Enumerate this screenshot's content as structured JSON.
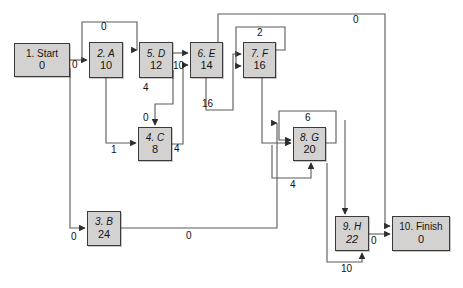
{
  "diagram": {
    "node_fill": "#d4d2d0",
    "node_stroke": "#3a3a3a",
    "edge_stroke": "#5a5a5a",
    "background": "#ffffff",
    "nodes": [
      {
        "id": "start",
        "name": "1. Start",
        "duration": "0",
        "italic_name": false,
        "italic_dur": false,
        "x": 14,
        "y": 43,
        "w": 56,
        "h": 34
      },
      {
        "id": "a",
        "name": "2. A",
        "duration": "10",
        "italic_name": true,
        "italic_dur": false,
        "x": 89,
        "y": 42,
        "w": 34,
        "h": 36
      },
      {
        "id": "d",
        "name": "5. D",
        "duration": "12",
        "italic_name": true,
        "italic_dur": false,
        "x": 139,
        "y": 42,
        "w": 34,
        "h": 36
      },
      {
        "id": "e",
        "name": "6. E",
        "duration": "14",
        "italic_name": true,
        "italic_dur": false,
        "x": 190,
        "y": 42,
        "w": 33,
        "h": 36
      },
      {
        "id": "f",
        "name": "7. F",
        "duration": "16",
        "italic_name": true,
        "italic_dur": false,
        "x": 243,
        "y": 42,
        "w": 33,
        "h": 36
      },
      {
        "id": "c",
        "name": "4. C",
        "duration": "8",
        "italic_name": true,
        "italic_dur": false,
        "x": 138,
        "y": 127,
        "w": 34,
        "h": 34
      },
      {
        "id": "g",
        "name": "8. G",
        "duration": "20",
        "italic_name": true,
        "italic_dur": false,
        "x": 293,
        "y": 127,
        "w": 33,
        "h": 34
      },
      {
        "id": "b",
        "name": "3. B",
        "duration": "24",
        "italic_name": true,
        "italic_dur": false,
        "x": 87,
        "y": 211,
        "w": 34,
        "h": 35
      },
      {
        "id": "h",
        "name": "9. H",
        "duration": "22",
        "italic_name": true,
        "italic_dur": false,
        "x": 335,
        "y": 216,
        "w": 34,
        "h": 35
      },
      {
        "id": "finish",
        "name": "10. Finish",
        "duration": "0",
        "italic_name": false,
        "italic_dur": false,
        "x": 392,
        "y": 216,
        "w": 58,
        "h": 35
      }
    ],
    "edge_labels": [
      {
        "id": "start-a",
        "text": "0",
        "x": 72,
        "y": 65
      },
      {
        "id": "a-d-top",
        "text": "0",
        "x": 101,
        "y": 27
      },
      {
        "id": "d-e",
        "text": "10",
        "x": 173,
        "y": 66
      },
      {
        "id": "d-c",
        "text": "4",
        "x": 143,
        "y": 88
      },
      {
        "id": "c-in-top",
        "text": "0",
        "x": 151,
        "y": 118
      },
      {
        "id": "a-c",
        "text": "1",
        "x": 111,
        "y": 149
      },
      {
        "id": "c-e",
        "text": "4",
        "x": 174,
        "y": 148
      },
      {
        "id": "e-f",
        "text": "16",
        "x": 205,
        "y": 103
      },
      {
        "id": "f-loop",
        "text": "2",
        "x": 256,
        "y": 32
      },
      {
        "id": "top-long",
        "text": "0",
        "x": 355,
        "y": 19
      },
      {
        "id": "g-loop",
        "text": "6",
        "x": 314,
        "y": 117
      },
      {
        "id": "g-in-low",
        "text": "4",
        "x": 293,
        "y": 184
      },
      {
        "id": "start-b",
        "text": "0",
        "x": 74,
        "y": 239
      },
      {
        "id": "b-h",
        "text": "0",
        "x": 189,
        "y": 235
      },
      {
        "id": "h-finish",
        "text": "0",
        "x": 372,
        "y": 239
      },
      {
        "id": "h-in-low",
        "text": "10",
        "x": 345,
        "y": 268
      }
    ]
  }
}
